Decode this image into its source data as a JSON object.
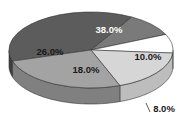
{
  "chart_data": {
    "type": "pie",
    "style": "3d-exploded-none",
    "title": "",
    "slices": [
      {
        "label": "38.0%",
        "value": 38.0,
        "color": "#5c5c5c",
        "side": "#3e3e3e",
        "text_color": "#ffffff"
      },
      {
        "label": "10.0%",
        "value": 10.0,
        "color": "#7a7a7a",
        "side": "#565656",
        "text_color": "#1a1a1a"
      },
      {
        "label": "8.0%",
        "value": 8.0,
        "color": "#ffffff",
        "side": "#e6e6e6",
        "text_color": "#1a1a1a"
      },
      {
        "label": "18.0%",
        "value": 18.0,
        "color": "#d6d6d6",
        "side": "#bdbdbd",
        "text_color": "#1a1a1a"
      },
      {
        "label": "26.0%",
        "value": 26.0,
        "color": "#a3a3a3",
        "side": "#808080",
        "text_color": "#1a1a1a"
      }
    ],
    "legend": null
  },
  "geometry": {
    "cx": 91,
    "cy": 50,
    "rx": 82,
    "ry": 38,
    "depth": 16
  }
}
